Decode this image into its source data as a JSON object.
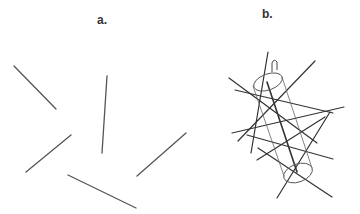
{
  "panels": [
    {
      "label": "a.",
      "description": "randomly oriented rods"
    },
    {
      "label": "b.",
      "description": "rods crossing a cylinder"
    }
  ],
  "colors": {
    "line": "#555555",
    "line_dark": "#333333",
    "background": "#ffffff"
  },
  "panel_a_lines": [
    [
      14,
      66,
      56,
      109
    ],
    [
      107,
      76,
      102,
      153
    ],
    [
      26,
      172,
      71,
      135
    ],
    [
      137,
      176,
      186,
      133
    ],
    [
      68,
      175,
      136,
      208
    ]
  ],
  "panel_b_lines": [
    [
      268,
      52,
      251,
      153
    ],
    [
      229,
      78,
      317,
      143
    ],
    [
      235,
      90,
      333,
      113
    ],
    [
      232,
      133,
      344,
      107
    ],
    [
      315,
      61,
      238,
      141
    ],
    [
      247,
      135,
      333,
      159
    ],
    [
      330,
      112,
      277,
      198
    ],
    [
      257,
      160,
      325,
      117
    ],
    [
      258,
      148,
      332,
      197
    ]
  ],
  "panel_b_rod": [
    267,
    82,
    297,
    172
  ],
  "cylinder": {
    "top": {
      "cx": 268,
      "cy": 82,
      "rx": 15,
      "ry": 8,
      "rotate": -20
    },
    "bottom": {
      "cx": 298,
      "cy": 173,
      "rx": 15,
      "ry": 9,
      "rotate": -20
    },
    "left_side": [
      253,
      86,
      284,
      176
    ],
    "right_side": [
      282,
      77,
      312,
      168
    ]
  }
}
